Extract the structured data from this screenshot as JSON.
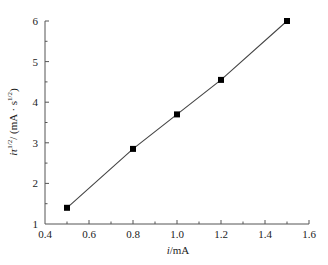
{
  "chart_data": {
    "type": "line",
    "title": "",
    "xlabel": "i/mA",
    "xlabel_parts": {
      "var": "i",
      "unit": "/mA"
    },
    "ylabel": "iτ^(1/2) / (mA·s^(1/2))",
    "ylabel_parts": {
      "var": "iτ",
      "sup1": "1/2",
      "unit_pre": "/ (mA · s",
      "sup2": "1/2",
      "unit_post": ")"
    },
    "xlim": [
      0.4,
      1.6
    ],
    "ylim": [
      1,
      6
    ],
    "xticks": [
      0.4,
      0.6,
      0.8,
      1.0,
      1.2,
      1.4,
      1.6
    ],
    "xtick_labels": [
      "0.4",
      "0.6",
      "0.8",
      "1.0",
      "1.2",
      "1.4",
      "1.6"
    ],
    "yticks": [
      1,
      2,
      3,
      4,
      5,
      6
    ],
    "ytick_labels": [
      "1",
      "2",
      "3",
      "4",
      "5",
      "6"
    ],
    "grid": false,
    "legend": null,
    "marker": "square",
    "series": [
      {
        "name": "iτ^(1/2)",
        "x": [
          0.5,
          0.8,
          1.0,
          1.2,
          1.5
        ],
        "y": [
          1.4,
          2.85,
          3.7,
          4.55,
          6.0
        ],
        "color": "#000000"
      }
    ]
  }
}
